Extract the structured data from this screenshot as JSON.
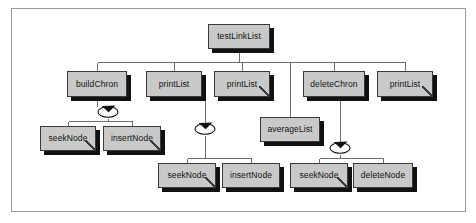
{
  "diagram": {
    "kind": "call-structure-tree",
    "frame": {
      "border_color": "#9a9a9a",
      "background": "#ffffff"
    },
    "box_style": {
      "fill": "#c9c9c9",
      "border_color": "#3a3a3a",
      "shadow_color": "#111111",
      "text_color": "#111111"
    },
    "connector_color": "#6e6e6e",
    "nodes": [
      {
        "id": "testLinkList",
        "label": "testLinkList",
        "leaf": false,
        "x": 208,
        "y": 24,
        "w": 62,
        "h": 25
      },
      {
        "id": "buildChron",
        "label": "buildChron",
        "leaf": false,
        "x": 67,
        "y": 71,
        "w": 60,
        "h": 26
      },
      {
        "id": "printList1",
        "label": "printList",
        "leaf": false,
        "x": 146,
        "y": 71,
        "w": 56,
        "h": 26
      },
      {
        "id": "printList2",
        "label": "printList",
        "leaf": true,
        "x": 214,
        "y": 71,
        "w": 56,
        "h": 26
      },
      {
        "id": "deleteChron",
        "label": "deleteChron",
        "leaf": false,
        "x": 303,
        "y": 71,
        "w": 62,
        "h": 26
      },
      {
        "id": "printList3",
        "label": "printList",
        "leaf": true,
        "x": 377,
        "y": 71,
        "w": 56,
        "h": 26
      },
      {
        "id": "seekNode1",
        "label": "seekNode",
        "leaf": true,
        "x": 40,
        "y": 126,
        "w": 56,
        "h": 25
      },
      {
        "id": "insertNode1",
        "label": "insertNode",
        "leaf": true,
        "x": 103,
        "y": 126,
        "w": 58,
        "h": 25
      },
      {
        "id": "averageList",
        "label": "averageList",
        "leaf": false,
        "x": 260,
        "y": 117,
        "w": 60,
        "h": 25
      },
      {
        "id": "seekNode2",
        "label": "seekNode",
        "leaf": true,
        "x": 158,
        "y": 163,
        "w": 58,
        "h": 25
      },
      {
        "id": "insertNode2",
        "label": "insertNode",
        "leaf": false,
        "x": 222,
        "y": 163,
        "w": 58,
        "h": 25
      },
      {
        "id": "seekNode3",
        "label": "seekNode",
        "leaf": true,
        "x": 290,
        "y": 163,
        "w": 58,
        "h": 25
      },
      {
        "id": "deleteNode",
        "label": "deleteNode",
        "leaf": false,
        "x": 353,
        "y": 163,
        "w": 60,
        "h": 25
      }
    ],
    "recursion_markers": [
      {
        "id": "loop-buildChron",
        "on": "buildChron",
        "cx": 108,
        "cy": 112
      },
      {
        "id": "loop-printList1",
        "on": "printList1",
        "cx": 205,
        "cy": 129
      },
      {
        "id": "loop-deleteChron",
        "on": "deleteChron",
        "cx": 340,
        "cy": 148
      }
    ],
    "edges": [
      {
        "id": "edge-root-bus",
        "from": "testLinkList",
        "to": "children-bus"
      },
      {
        "id": "edge-buildChron",
        "from": "testLinkList",
        "to": "buildChron"
      },
      {
        "id": "edge-printList1",
        "from": "testLinkList",
        "to": "printList1"
      },
      {
        "id": "edge-printList2",
        "from": "testLinkList",
        "to": "printList2"
      },
      {
        "id": "edge-averageList",
        "from": "testLinkList",
        "to": "averageList"
      },
      {
        "id": "edge-deleteChron",
        "from": "testLinkList",
        "to": "deleteChron"
      },
      {
        "id": "edge-printList3",
        "from": "testLinkList",
        "to": "printList3"
      },
      {
        "id": "edge-buildChron-sub",
        "from": "buildChron",
        "to": "seekNode1"
      },
      {
        "id": "edge-buildChron-sub2",
        "from": "buildChron",
        "to": "insertNode1"
      },
      {
        "id": "edge-printList1-sub",
        "from": "printList1",
        "to": "seekNode2"
      },
      {
        "id": "edge-printList1-sub2",
        "from": "printList1",
        "to": "insertNode2"
      },
      {
        "id": "edge-deleteChron-sub",
        "from": "deleteChron",
        "to": "seekNode3"
      },
      {
        "id": "edge-deleteChron-sub2",
        "from": "deleteChron",
        "to": "deleteNode"
      }
    ]
  }
}
